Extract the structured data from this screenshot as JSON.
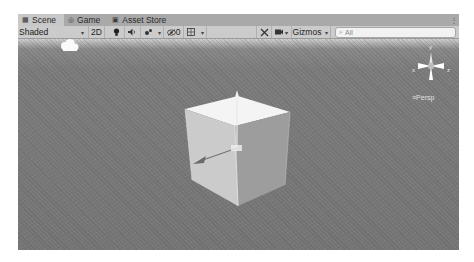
{
  "tabs": [
    {
      "icon": "scene-icon",
      "glyph": "▦",
      "label": "Scene",
      "active": true
    },
    {
      "icon": "game-icon",
      "glyph": "◎",
      "label": "Game",
      "active": false
    },
    {
      "icon": "asset-store-icon",
      "glyph": "▣",
      "label": "Asset Store",
      "active": false
    }
  ],
  "tab_menu_glyph": "⋮",
  "toolbar": {
    "draw_mode": "Shaded",
    "dropdown_glyph": "▾",
    "mode_2d": "2D",
    "lighting_glyph": "💡",
    "audio_glyph": "◀)",
    "effects_glyph": "✦",
    "hidden_count": "0",
    "hidden_glyph": "ⓧ",
    "grid_glyph": "▦",
    "tools_glyph": "✕",
    "camera_glyph": "■",
    "gizmos_label": "Gizmos",
    "search_icon": "⌕",
    "search_placeholder": "All"
  },
  "viewport": {
    "projection_label": "≡Persp",
    "axis_labels": {
      "y": "y",
      "x": "x",
      "z": "z"
    }
  },
  "colors": {
    "tab_bar": "#a9a9a9",
    "toolbar": "#cbcbcb",
    "viewport_bg": "#767676",
    "cube_top": "#f4f4f4",
    "cube_left": "#c9c9c9",
    "cube_right": "#9d9d9d"
  }
}
